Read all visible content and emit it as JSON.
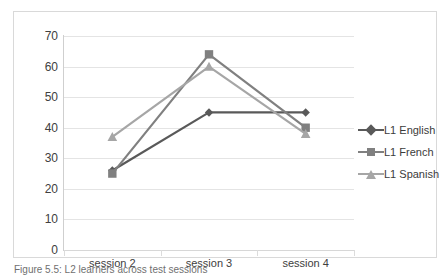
{
  "chart_data": {
    "type": "line",
    "title": "",
    "xlabel": "",
    "ylabel": "",
    "categories": [
      "session 2",
      "session 3",
      "session 4"
    ],
    "ylim": [
      0,
      70
    ],
    "ytick_labels": [
      "0",
      "10",
      "20",
      "30",
      "40",
      "50",
      "60",
      "70"
    ],
    "ytick_values": [
      0,
      10,
      20,
      30,
      40,
      50,
      60,
      70
    ],
    "grid": true,
    "legend_position": "right",
    "series": [
      {
        "name": "L1 English",
        "marker": "diamond",
        "color": "#595959",
        "values": [
          26,
          45,
          45
        ]
      },
      {
        "name": "L1 French",
        "marker": "square",
        "color": "#808080",
        "values": [
          25,
          64,
          40
        ]
      },
      {
        "name": "L1 Spanish",
        "marker": "triangle",
        "color": "#a6a6a6",
        "values": [
          37,
          60,
          38
        ]
      }
    ]
  },
  "legend": {
    "items": [
      {
        "label": "L1 English"
      },
      {
        "label": "L1 French"
      },
      {
        "label": "L1 Spanish"
      }
    ]
  },
  "axes": {
    "y_ticks": [
      "70",
      "60",
      "50",
      "40",
      "30",
      "20",
      "10",
      "0"
    ],
    "x_ticks": [
      "session 2",
      "session 3",
      "session 4"
    ]
  },
  "caption": {
    "text": "Figure 5.5: L2 learners across test sessions"
  }
}
